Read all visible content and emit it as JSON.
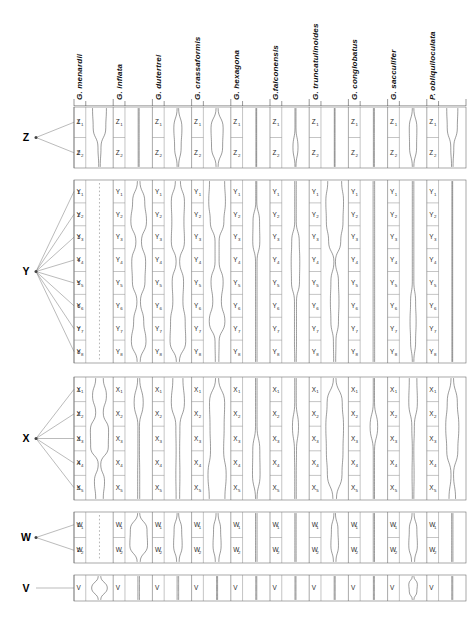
{
  "figure": {
    "width": 473,
    "height": 624,
    "line_color": "#4a4a4a",
    "grid_color": "#8a8a8a"
  },
  "taxa": [
    {
      "id": "menardii",
      "label": "G. menardii"
    },
    {
      "id": "inflata",
      "label": "G. inflata"
    },
    {
      "id": "dutertrei",
      "label": "G. dutertrei"
    },
    {
      "id": "crassaformis",
      "label": "G. crassaformis"
    },
    {
      "id": "hexagona",
      "label": "G. hexagona"
    },
    {
      "id": "falconensis",
      "label": "G.falconensis"
    },
    {
      "id": "truncatulinoides",
      "label": "G. truncatulinoides"
    },
    {
      "id": "conglobatus",
      "label": "G. conglobatus"
    },
    {
      "id": "sacculifer",
      "label": "G. sacculifer"
    },
    {
      "id": "obliquiloculata",
      "label": "P. obliquiloculata"
    }
  ],
  "zones": [
    {
      "id": "Z",
      "letter": "Z",
      "row_numbers": [
        "1",
        "2"
      ],
      "sub_labels": [
        "Z",
        "Z"
      ],
      "sub_subscripts": [
        "1",
        "2"
      ]
    },
    {
      "id": "Y",
      "letter": "Y",
      "row_numbers": [
        "1",
        "2",
        "3",
        "4",
        "5",
        "6",
        "7",
        "8"
      ],
      "sub_labels": [
        "Y",
        "Y",
        "Y",
        "Y",
        "Y",
        "Y",
        "Y",
        "Y"
      ],
      "sub_subscripts": [
        "1",
        "2",
        "3",
        "4",
        "5",
        "6",
        "7",
        "8"
      ]
    },
    {
      "id": "X",
      "letter": "X",
      "row_numbers": [
        "1",
        "2",
        "3",
        "4",
        "5"
      ],
      "sub_labels": [
        "X",
        "X",
        "X",
        "X",
        "X"
      ],
      "sub_subscripts": [
        "1",
        "2",
        "3",
        "4",
        "5"
      ]
    },
    {
      "id": "W",
      "letter": "W",
      "row_numbers": [
        "1",
        "2"
      ],
      "sub_labels": [
        "W",
        "W"
      ],
      "sub_subscripts": [
        "1",
        "2"
      ]
    },
    {
      "id": "V",
      "letter": "V",
      "row_numbers": [],
      "sub_labels": [
        "V"
      ],
      "sub_subscripts": [
        ""
      ]
    }
  ],
  "chart_data": {
    "type": "area",
    "xlabel": "",
    "ylabel": "",
    "orientation": "vertical-depth",
    "categories": [
      "Z",
      "Y",
      "X",
      "W",
      "V"
    ],
    "series": [
      {
        "name": "G. menardii",
        "Z": [
          0.55,
          0.5,
          0.12,
          0.06
        ],
        "Y": [
          0.02,
          0.02,
          0.02,
          0.02,
          0.02,
          0.02,
          0.02,
          0.02,
          0.02
        ],
        "X": [
          0.3,
          0.55,
          0.3,
          0.72,
          0.7,
          0.1,
          0.4,
          0.3
        ],
        "W": [
          0.04,
          0.04,
          0.04
        ],
        "V": [
          0.1,
          0.62,
          0.1
        ],
        "style": {
          "Z": "solid",
          "Y": "dashed",
          "X": "mixed",
          "W": "dashed",
          "V": "solid"
        }
      },
      {
        "name": "G. inflata",
        "Z": [
          0.04,
          0.04,
          0.04,
          0.04
        ],
        "Y": [
          0.1,
          0.48,
          0.62,
          0.22,
          0.55,
          0.5,
          0.14,
          0.4,
          0.58,
          0.12
        ],
        "X": [
          0.08,
          0.36,
          0.06,
          0.06,
          0.08,
          0.08
        ],
        "W": [
          0.08,
          0.66,
          0.7,
          0.12
        ],
        "V": [
          0.06,
          0.06,
          0.06
        ]
      },
      {
        "name": "G. dutertrei",
        "Z": [
          0.06,
          0.32,
          0.26,
          0.06
        ],
        "Y": [
          0.2,
          0.52,
          0.48,
          0.52,
          0.14,
          0.45,
          0.4,
          0.58,
          0.62,
          0.12
        ],
        "X": [
          0.4,
          0.52,
          0.16,
          0.14,
          0.16,
          0.14
        ],
        "W": [
          0.06,
          0.3,
          0.34,
          0.1
        ],
        "V": [
          0.06,
          0.06,
          0.06
        ]
      },
      {
        "name": "G. crassaformis",
        "Z": [
          0.08,
          0.48,
          0.44,
          0.08
        ],
        "Y": [
          0.6,
          0.66,
          0.54,
          0.16,
          0.16,
          0.48,
          0.34,
          0.62,
          0.16,
          0.14
        ],
        "X": [
          0.12,
          0.6,
          0.56,
          0.52,
          0.72,
          0.62
        ],
        "W": [
          0.08,
          0.28,
          0.32,
          0.14
        ],
        "V": [
          0.04,
          0.04,
          0.04
        ]
      },
      {
        "name": "G. hexagona",
        "Z": [
          0.03,
          0.03,
          0.03,
          0.03
        ],
        "Y": [
          0.04,
          0.04,
          0.26,
          0.28,
          0.06,
          0.06,
          0.06,
          0.06,
          0.06,
          0.06
        ],
        "X": [
          0.06,
          0.06,
          0.06,
          0.28,
          0.3,
          0.06
        ],
        "W": [
          0.06,
          0.06,
          0.06,
          0.06
        ],
        "V": [
          0.04,
          0.04,
          0.04
        ]
      },
      {
        "name": "G.falconensis",
        "Z": [
          0.04,
          0.04,
          0.2,
          0.04
        ],
        "Y": [
          0.06,
          0.06,
          0.06,
          0.3,
          0.34,
          0.32,
          0.08,
          0.08,
          0.08,
          0.06
        ],
        "X": [
          0.06,
          0.06,
          0.24,
          0.08,
          0.06,
          0.06
        ],
        "W": [
          0.05,
          0.05,
          0.05,
          0.05
        ],
        "V": [
          0.04,
          0.04,
          0.04
        ]
      },
      {
        "name": "G. truncatulinoides",
        "Z": [
          0.03,
          0.03,
          0.03,
          0.03
        ],
        "Y": [
          0.55,
          0.7,
          0.66,
          0.48,
          0.06,
          0.3,
          0.34,
          0.3,
          0.1,
          0.08
        ],
        "X": [
          0.1,
          0.6,
          0.7,
          0.66,
          0.58,
          0.14
        ],
        "W": [
          0.06,
          0.26,
          0.3,
          0.1
        ],
        "V": [
          0.04,
          0.04,
          0.04
        ]
      },
      {
        "name": "G. conglobatus",
        "Z": [
          0.04,
          0.04,
          0.04,
          0.04
        ],
        "Y": [
          0.06,
          0.06,
          0.06,
          0.06,
          0.06,
          0.06,
          0.06,
          0.06,
          0.06,
          0.06
        ],
        "X": [
          0.05,
          0.05,
          0.3,
          0.05,
          0.05,
          0.05
        ],
        "W": [
          0.05,
          0.05,
          0.05,
          0.05
        ],
        "V": [
          0.04,
          0.04,
          0.04
        ]
      },
      {
        "name": "G. sacculifer",
        "Z": [
          0.06,
          0.3,
          0.28,
          0.06
        ],
        "Y": [
          0.06,
          0.06,
          0.06,
          0.06,
          0.06,
          0.06,
          0.2,
          0.24,
          0.2,
          0.06
        ],
        "X": [
          0.3,
          0.34,
          0.1,
          0.06,
          0.08,
          0.06
        ],
        "W": [
          0.08,
          0.3,
          0.34,
          0.12
        ],
        "V": [
          0.06,
          0.34,
          0.3,
          0.06
        ]
      },
      {
        "name": "P. obliquiloculata",
        "Z": [
          0.44,
          0.4,
          0.12,
          0.06
        ],
        "Y": [
          0.03,
          0.03,
          0.03,
          0.03,
          0.03,
          0.03,
          0.03,
          0.03,
          0.03,
          0.03
        ],
        "X": [
          0.1,
          0.4,
          0.52,
          0.44,
          0.1,
          0.26
        ],
        "W": [
          0.05,
          0.05,
          0.05,
          0.05
        ],
        "V": [
          0.04,
          0.04,
          0.04
        ]
      }
    ]
  }
}
